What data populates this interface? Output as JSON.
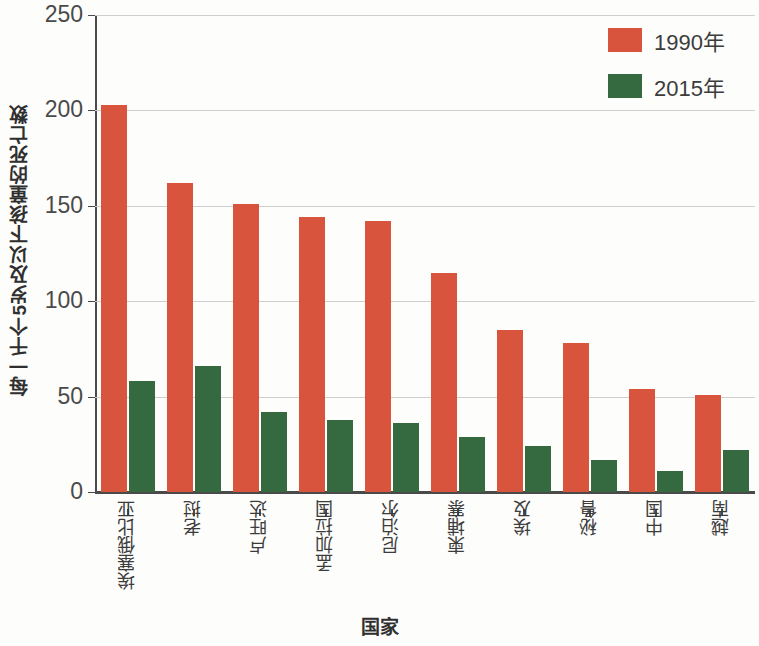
{
  "chart_data": {
    "type": "bar",
    "title": "",
    "xlabel": "国家",
    "ylabel": "每一千个5岁及以下孩童的死亡数",
    "categories": [
      "埃塞俄比亚",
      "老挝",
      "卢旺达",
      "孟加拉国",
      "尼泊尔",
      "柬埔寨",
      "埃及",
      "秘鲁",
      "中国",
      "越南"
    ],
    "series": [
      {
        "name": "1990年",
        "color": "#d9543c",
        "values": [
          203,
          162,
          151,
          144,
          142,
          115,
          85,
          78,
          54,
          51
        ]
      },
      {
        "name": "2015年",
        "color": "#35693f",
        "values": [
          58,
          66,
          42,
          38,
          36,
          29,
          24,
          17,
          11,
          22
        ]
      }
    ],
    "ylim": [
      0,
      250
    ],
    "yticks": [
      0,
      50,
      100,
      150,
      200,
      250
    ],
    "ytick_labels": [
      "0",
      "50",
      "100",
      "150",
      "200",
      "250"
    ],
    "grid": true,
    "legend_position": "top-right"
  },
  "legend": {
    "items": [
      {
        "label": "1990年",
        "color": "#d9543c"
      },
      {
        "label": "2015年",
        "color": "#35693f"
      }
    ]
  },
  "axes": {
    "y_title": "每一千个5岁及以下孩童的死亡数",
    "x_title": "国家"
  }
}
